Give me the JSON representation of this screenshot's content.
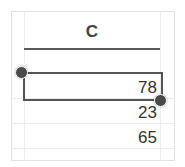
{
  "spreadsheet": {
    "column_header": "C",
    "cells": [
      {
        "value": "78",
        "selected": true
      },
      {
        "value": "23",
        "selected": false
      },
      {
        "value": "65",
        "selected": false
      }
    ]
  },
  "colors": {
    "gridline": "#ececec",
    "selection_border": "#555555",
    "handle": "#4a4a4a",
    "text": "#333333"
  }
}
